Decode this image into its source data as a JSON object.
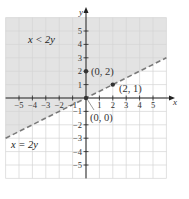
{
  "chart_data": {
    "type": "line",
    "title": "",
    "xlabel": "x",
    "ylabel": "y",
    "xlim": [
      -6,
      6
    ],
    "ylim": [
      -6,
      6
    ],
    "grid": true,
    "x_ticks": [
      "-5",
      "-4",
      "-3",
      "-2",
      "-1",
      "1",
      "2",
      "3",
      "4",
      "5"
    ],
    "y_ticks": [
      "5",
      "4",
      "3",
      "2",
      "1",
      "-1",
      "-2",
      "-3",
      "-4",
      "-5"
    ],
    "boundary_line": {
      "equation": "x = 2y",
      "style": "dashed",
      "points": [
        [
          -6,
          -3
        ],
        [
          6,
          3
        ]
      ]
    },
    "shaded_region": {
      "inequality": "x < 2y",
      "side": "above-left"
    },
    "marked_points": [
      {
        "x": 0,
        "y": 2,
        "label": "(0, 2)"
      },
      {
        "x": 2,
        "y": 1,
        "label": "(2, 1)"
      },
      {
        "x": 0,
        "y": 0,
        "label": "(0, 0)"
      }
    ],
    "annotations": [
      "x < 2y",
      "x = 2y"
    ]
  },
  "labels": {
    "x_axis": "x",
    "y_axis": "y",
    "inequality": "x < 2y",
    "boundary": "x = 2y",
    "p02": "(0, 2)",
    "p21": "(2, 1)",
    "p00": "(0, 0)"
  },
  "colors": {
    "shade": "#e3e3e3",
    "grid": "#d4d4d4",
    "axis": "#222222",
    "dash": "#7a7a7a"
  }
}
